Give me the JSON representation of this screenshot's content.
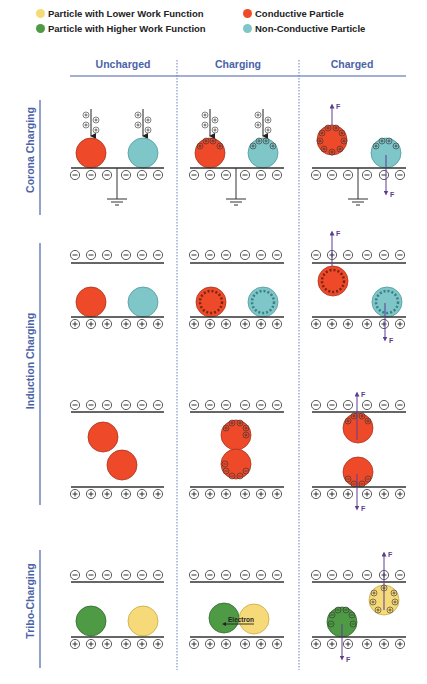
{
  "legend": {
    "items": [
      {
        "label": "Particle with Lower Work Function",
        "color": "#f6da7a"
      },
      {
        "label": "Particle with Higher Work Function",
        "color": "#4f9a45"
      },
      {
        "label": "Conductive Particle",
        "color": "#ee4a2a"
      },
      {
        "label": "Non-Conductive Particle",
        "color": "#7fc6c9"
      }
    ]
  },
  "columns": [
    {
      "label": "Uncharged"
    },
    {
      "label": "Charging"
    },
    {
      "label": "Charged"
    }
  ],
  "rows": [
    {
      "label": "Corona Charging"
    },
    {
      "label": "Induction Charging"
    },
    {
      "label": "Tribo-Charging"
    }
  ],
  "annotations": {
    "force": "F",
    "electron": "Electron"
  },
  "colors": {
    "accent": "#4a63a8",
    "conductive": "#ee4a2a",
    "conductive_stroke": "#a8321c",
    "non_conductive": "#7fc6c9",
    "non_conductive_stroke": "#4f9aa0",
    "lower_wf": "#f6da7a",
    "lower_wf_stroke": "#c8a940",
    "higher_wf": "#4f9a45",
    "higher_wf_stroke": "#2e6a2a",
    "force_arrow": "#5b3f8f",
    "plate": "#333333"
  }
}
